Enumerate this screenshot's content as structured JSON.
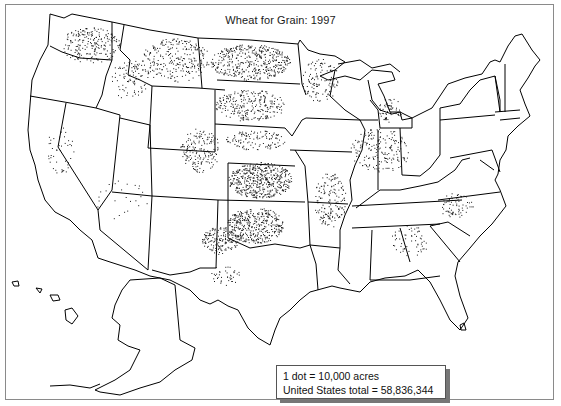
{
  "map": {
    "title": "Wheat for Grain:  1997",
    "legend": {
      "dot_value": "1 dot = 10,000 acres",
      "total": "United States total = 58,836,344"
    },
    "colors": {
      "background": "#ffffff",
      "outline": "#000000",
      "dots": "#1a1a1a",
      "frame": "#8a8a8a"
    },
    "density_regions": [
      {
        "name": "Washington (east)",
        "level": "high"
      },
      {
        "name": "Montana",
        "level": "high"
      },
      {
        "name": "North Dakota",
        "level": "very high"
      },
      {
        "name": "South Dakota",
        "level": "high"
      },
      {
        "name": "Minnesota (west)",
        "level": "high"
      },
      {
        "name": "Kansas",
        "level": "very high"
      },
      {
        "name": "Oklahoma",
        "level": "very high"
      },
      {
        "name": "Texas (panhandle)",
        "level": "high"
      },
      {
        "name": "Colorado (east)",
        "level": "high"
      },
      {
        "name": "Nebraska",
        "level": "medium"
      },
      {
        "name": "Idaho",
        "level": "medium"
      },
      {
        "name": "Oregon (northeast)",
        "level": "medium"
      },
      {
        "name": "Ohio / Indiana / Illinois",
        "level": "medium"
      },
      {
        "name": "Arkansas / Mississippi delta",
        "level": "medium"
      },
      {
        "name": "Michigan",
        "level": "low"
      },
      {
        "name": "North Carolina",
        "level": "low"
      },
      {
        "name": "California",
        "level": "low"
      }
    ]
  }
}
